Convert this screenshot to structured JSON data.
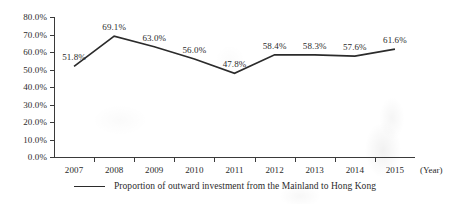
{
  "chart_data": {
    "type": "line",
    "title": "",
    "subtitle": "",
    "xlabel": "(Year)",
    "ylabel": "",
    "categories": [
      "2007",
      "2008",
      "2009",
      "2010",
      "2011",
      "2012",
      "2013",
      "2014",
      "2015"
    ],
    "values": [
      51.8,
      69.1,
      63.0,
      56.0,
      47.8,
      58.4,
      58.3,
      57.6,
      61.6
    ],
    "point_labels": [
      "51.8%",
      "69.1%",
      "63.0%",
      "56.0%",
      "47.8%",
      "58.4%",
      "58.3%",
      "57.6%",
      "61.6%"
    ],
    "ylim": [
      0,
      80
    ],
    "ytick_values": [
      0,
      10,
      20,
      30,
      40,
      50,
      60,
      70,
      80
    ],
    "ytick_labels": [
      "0.0%",
      "10.0%",
      "20.0%",
      "30.0%",
      "40.0%",
      "50.0%",
      "60.0%",
      "70.0%",
      "80.0%"
    ],
    "grid": false,
    "legend_position": "bottom",
    "series": [
      {
        "name": "Proportion of outward investment from the Mainland to Hong Kong",
        "values": [
          51.8,
          69.1,
          63.0,
          56.0,
          47.8,
          58.4,
          58.3,
          57.6,
          61.6
        ],
        "color": "#2b2b2b",
        "marker": "none"
      }
    ]
  },
  "legend": {
    "entries": [
      {
        "label": "Proportion of outward investment from the Mainland to Hong Kong"
      }
    ]
  },
  "axis": {
    "x_unit_label": "(Year)"
  },
  "colors": {
    "line": "#2b2b2b",
    "axis": "#3a3a3a",
    "text": "#2b2b2b",
    "background": "#ffffff"
  }
}
